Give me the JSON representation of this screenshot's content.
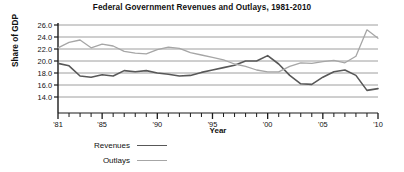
{
  "chart_data": {
    "type": "line",
    "title": "Federal Government Revenues and Outlays, 1981-2010",
    "xlabel": "Year",
    "ylabel": "Share of GDP",
    "grid": true,
    "legend_position": "bottom-left",
    "xlim": [
      1981,
      2010
    ],
    "ylim": [
      13.0,
      26.0
    ],
    "ytick_values": [
      26.0,
      24.0,
      22.0,
      20.0,
      18.0,
      16.0,
      14.0
    ],
    "ytick_labels": [
      "26.0",
      "24.0",
      "22.0",
      "20.0",
      "18.0",
      "16.0",
      "14.0"
    ],
    "xtick_values": [
      1981,
      1985,
      1990,
      1995,
      2000,
      2005,
      2010
    ],
    "xtick_labels": [
      "'81",
      "'85",
      "'90",
      "'95",
      "'00",
      "'05",
      "'10"
    ],
    "minor_xticks_every": 1,
    "x": [
      1981,
      1982,
      1983,
      1984,
      1985,
      1986,
      1987,
      1988,
      1989,
      1990,
      1991,
      1992,
      1993,
      1994,
      1995,
      1996,
      1997,
      1998,
      1999,
      2000,
      2001,
      2002,
      2003,
      2004,
      2005,
      2006,
      2007,
      2008,
      2009,
      2010
    ],
    "series": [
      {
        "name": "Revenues",
        "color": "#585858",
        "width": 1.6,
        "values": [
          19.6,
          19.2,
          17.5,
          17.3,
          17.7,
          17.5,
          18.4,
          18.2,
          18.4,
          18.0,
          17.8,
          17.5,
          17.6,
          18.1,
          18.5,
          18.9,
          19.3,
          20.0,
          20.0,
          20.9,
          19.5,
          17.6,
          16.2,
          16.1,
          17.3,
          18.2,
          18.5,
          17.6,
          15.1,
          15.4
        ]
      },
      {
        "name": "Outlays",
        "color": "#a6a6a6",
        "width": 1.3,
        "values": [
          22.2,
          23.1,
          23.5,
          22.2,
          22.8,
          22.5,
          21.6,
          21.3,
          21.2,
          21.9,
          22.3,
          22.1,
          21.4,
          21.0,
          20.6,
          20.2,
          19.5,
          19.1,
          18.5,
          18.2,
          18.2,
          19.1,
          19.7,
          19.6,
          19.9,
          20.1,
          19.7,
          20.8,
          25.2,
          23.8
        ]
      }
    ]
  },
  "legend": {
    "items": [
      {
        "label": "Revenues"
      },
      {
        "label": "Outlays"
      }
    ]
  }
}
